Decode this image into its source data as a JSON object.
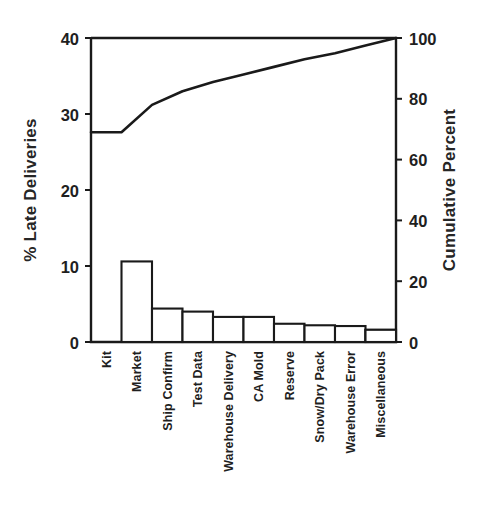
{
  "chart_data": {
    "type": "bar",
    "chart_kind": "pareto",
    "title": "",
    "subtitle": "",
    "categories": [
      "Kit",
      "Market",
      "Ship Confirm",
      "Test Data",
      "Warehouse Delivery",
      "CA Mold",
      "Reserve",
      "Snow/Dry Pack",
      "Warehouse Error",
      "Miscellaneous"
    ],
    "series": [
      {
        "name": "% Late Deliveries",
        "type": "bar",
        "axis": "left",
        "values": [
          27.5,
          10.6,
          4.4,
          4.0,
          3.3,
          3.3,
          2.4,
          2.2,
          2.1,
          1.6
        ]
      },
      {
        "name": "Cumulative Percent",
        "type": "line",
        "axis": "right",
        "values": [
          69.0,
          78.0,
          82.5,
          85.5,
          88.0,
          90.5,
          93.0,
          95.0,
          97.5,
          100.0
        ]
      }
    ],
    "xlabel": "",
    "ylabel": "% Late Deliveries",
    "y2label": "Cumulative Percent",
    "ylim": [
      0,
      40
    ],
    "y2lim": [
      0,
      100
    ],
    "yticks": [
      "0",
      "10",
      "20",
      "30",
      "40"
    ],
    "ytick_values": [
      0,
      10,
      20,
      30,
      40
    ],
    "y2ticks": [
      "0",
      "20",
      "40",
      "60",
      "80",
      "100"
    ],
    "y2tick_values": [
      0,
      20,
      40,
      60,
      80,
      100
    ],
    "grid": false,
    "legend": "none",
    "legend_position": "none",
    "colors": {
      "bar_fill": "#ffffff",
      "bar_stroke": "#1a1a1a",
      "line": "#1a1a1a",
      "background": "#ffffff",
      "text": "#1f1f1f"
    }
  },
  "axes": {
    "left_title": "% Late Deliveries",
    "right_title": "Cumulative Percent"
  }
}
